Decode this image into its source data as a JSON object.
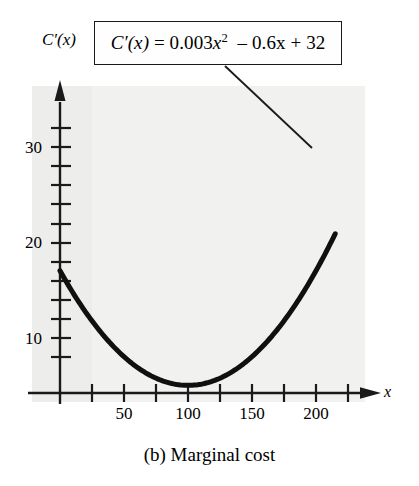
{
  "figure": {
    "caption": "(b) Marginal cost",
    "equation_box": {
      "lhs": "C′(x)",
      "eq": "=",
      "coef_quadratic": "0.003",
      "var": "x",
      "exponent": "2",
      "term_linear": "– 0.6x",
      "term_constant": "+ 32",
      "full": "C′(x) = 0.003x² – 0.6x + 32"
    },
    "ylabel": "C′(x)",
    "xlabel": "x",
    "colors": {
      "curve": "#101010",
      "axis": "#1a1a1a",
      "box_border": "#1a1a1a",
      "paper": "#f1f1f0",
      "page": "#ffffff"
    }
  },
  "chart_data": {
    "type": "line",
    "title": "(b) Marginal cost",
    "xlabel": "x",
    "ylabel": "C'(x)",
    "function": "C'(x) = 0.003x^2 - 0.6x + 32",
    "coefficients": {
      "a": 0.003,
      "b": -0.6,
      "c": 32
    },
    "vertex": {
      "x": 100,
      "y": 2
    },
    "xlim": [
      0,
      235
    ],
    "ylim": [
      0,
      40
    ],
    "grid": false,
    "legend": "none",
    "annotations": [
      {
        "text": "C′(x) = 0.003x² – 0.6x + 32",
        "leader_from": [
          225,
          66
        ],
        "leader_to": [
          312,
          148
        ]
      }
    ],
    "x_ticks_major": [
      50,
      100,
      150,
      200
    ],
    "x_tick_labels": [
      "50",
      "100",
      "150",
      "200"
    ],
    "x_ticks_minor": [
      25,
      75,
      125,
      175,
      225
    ],
    "y_ticks_major": [
      10,
      20,
      30
    ],
    "y_tick_labels": [
      "10",
      "20",
      "30"
    ],
    "y_ticks_minor": [
      5,
      15,
      25,
      35
    ],
    "x": [
      0,
      10,
      20,
      30,
      40,
      50,
      60,
      70,
      80,
      90,
      100,
      110,
      120,
      130,
      140,
      150,
      160,
      170,
      180,
      190,
      200,
      210,
      215
    ],
    "values": [
      32.0,
      26.3,
      21.2,
      16.7,
      12.8,
      9.5,
      6.8,
      4.7,
      3.2,
      2.3,
      2.0,
      2.3,
      3.2,
      4.7,
      6.8,
      9.5,
      12.8,
      16.7,
      21.2,
      26.3,
      32.0,
      38.3,
      41.6
    ]
  }
}
